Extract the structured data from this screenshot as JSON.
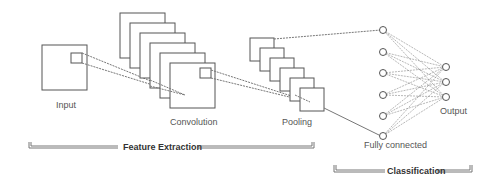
{
  "diagram": {
    "type": "cnn-architecture",
    "stages": {
      "input": {
        "label": "Input"
      },
      "convolution": {
        "label": "Convolution",
        "feature_maps": 6
      },
      "pooling": {
        "label": "Pooling",
        "feature_maps": 6
      },
      "fully_connected": {
        "label": "Fully connected",
        "nodes": 6
      },
      "output": {
        "label": "Output",
        "nodes": 3
      }
    },
    "groups": {
      "feature_extraction": {
        "label": "Feature Extraction"
      },
      "classification": {
        "label": "Classification"
      }
    },
    "colors": {
      "stroke": "#555555",
      "text": "#555555",
      "background": "#ffffff"
    }
  }
}
